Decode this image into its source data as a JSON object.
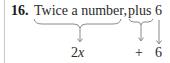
{
  "problem": {
    "number": "16.",
    "phrases": [
      {
        "text": "Twice a number,"
      },
      {
        "text": "plus"
      },
      {
        "text": "6"
      }
    ],
    "translation": {
      "coefficient": "2",
      "variable": "x",
      "operator": "+",
      "constant": "6"
    }
  },
  "colors": {
    "text": "#2a2a2a",
    "brace": "#8a8a8a",
    "arrow": "#8a8a8a",
    "rule": "#c8c8c8"
  }
}
